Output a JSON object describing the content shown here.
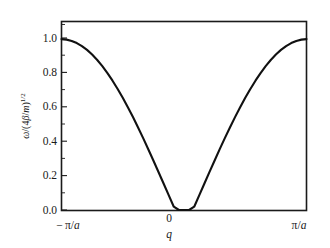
{
  "chart_data": {
    "type": "line",
    "title": "",
    "subtitle": "",
    "xlabel": "q",
    "ylabel": "ω/(4β/m)",
    "ylabel_exponent": "1/2",
    "ylabel_plain": "ω/(4β/m)^{1/2}",
    "xlim": [
      -3.141592653589793,
      3.141592653589793
    ],
    "ylim": [
      0.0,
      1.12
    ],
    "grid": false,
    "legend": null,
    "x_tick_labels": [
      "−π/a",
      "0",
      "π/a"
    ],
    "x_tick_values": [
      -3.141592653589793,
      0,
      3.141592653589793
    ],
    "x_axis_symbol": "q",
    "y_tick_labels": [
      "0.0",
      "0.2",
      "0.4",
      "0.6",
      "0.8",
      "1.0"
    ],
    "y_tick_values": [
      0.0,
      0.2,
      0.4,
      0.6,
      0.8,
      1.0
    ],
    "y_minor_ticks": [
      0.1,
      0.3,
      0.5,
      0.7,
      0.9,
      1.1
    ],
    "curve_color": "#111111",
    "frame_color": "#1a1a1a",
    "background_color": "#ffffff",
    "series": [
      {
        "name": "phonon dispersion",
        "formula": "ω = |sin(qa/2)|",
        "x": [
          -3.141592653589793,
          -3.0106929,
          -2.8797933,
          -2.7488936,
          -2.6179939,
          -2.4870942,
          -2.3561945,
          -2.2252948,
          -2.0943951,
          -1.9634954,
          -1.8325957,
          -1.701696,
          -1.5707963,
          -1.4398966,
          -1.3089969,
          -1.1780972,
          -1.0471976,
          -0.9162979,
          -0.7853982,
          -0.6544985,
          -0.5235988,
          -0.3926991,
          -0.2617994,
          -0.1308997,
          0.0,
          0.1308997,
          0.2617994,
          0.3926991,
          0.5235988,
          0.6544985,
          0.7853982,
          0.9162979,
          1.0471976,
          1.1780972,
          1.3089969,
          1.4398966,
          1.5707963,
          1.701696,
          1.8325957,
          1.9634954,
          2.0943951,
          2.2252948,
          2.3561945,
          2.4870942,
          2.6179939,
          2.7488936,
          2.8797933,
          3.0106929,
          3.141592653589793
        ],
        "y": [
          1.015,
          1.0124,
          1.0047,
          0.9919,
          0.9741,
          0.9513,
          0.9237,
          0.8915,
          0.8547,
          0.8136,
          0.7684,
          0.7193,
          0.6667,
          0.6108,
          0.552,
          0.4905,
          0.4268,
          0.3613,
          0.2942,
          0.2261,
          0.1573,
          0.0882,
          0.0194,
          0.0,
          0.0,
          0.0,
          0.0194,
          0.0882,
          0.1573,
          0.2261,
          0.2942,
          0.3613,
          0.4268,
          0.4905,
          0.552,
          0.6108,
          0.6667,
          0.7193,
          0.7684,
          0.8136,
          0.8547,
          0.8915,
          0.9237,
          0.9513,
          0.9741,
          0.9919,
          1.0047,
          1.0124,
          1.015
        ]
      }
    ]
  }
}
